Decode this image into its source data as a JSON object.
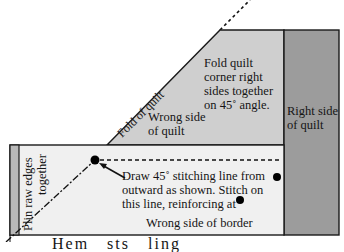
{
  "diagram": {
    "colors": {
      "wrong_side_quilt": "#cfcfcf",
      "right_side_quilt": "#9c9c9c",
      "border": "#f0f0f0",
      "strip": "#b9b9b9",
      "outline": "#1a1a1a"
    },
    "labels": {
      "fold_of_quilt": "Fold of quilt",
      "fold_instruction": [
        "Fold quilt",
        "corner right",
        "sides together",
        "on 45˚ angle."
      ],
      "wrong_side_quilt": [
        "Wrong side",
        "of quilt"
      ],
      "right_side_quilt": [
        "Right side",
        "of quilt"
      ],
      "pin_raw_edges": [
        "Plin  raw edges",
        "together"
      ],
      "draw_instruction": [
        "Draw 45˚  stitching line from",
        "outward as shown.  Stitch on",
        "this line, reinforcing at"
      ],
      "wrong_side_border": "Wrong side of border",
      "cut_off_bottom": "Hem    sts    ling"
    }
  }
}
